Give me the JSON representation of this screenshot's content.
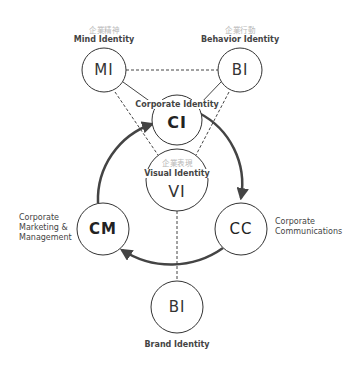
{
  "diagram": {
    "title": "",
    "nodes": {
      "mi": {
        "abbr": "MI",
        "label": "Mind Identity",
        "label_jp": "企業精神"
      },
      "bi_top": {
        "abbr": "BI",
        "label": "Behavior Identity",
        "label_jp": "企業行動"
      },
      "ci": {
        "abbr": "CI",
        "label": "Corporate Identity"
      },
      "vi": {
        "abbr": "VI",
        "label": "Visual Identity",
        "label_jp": "企業表現"
      },
      "cm": {
        "abbr": "CM",
        "label_lines": [
          "Corporate",
          "Marketing &",
          "Management"
        ]
      },
      "cc": {
        "abbr": "CC",
        "label_lines": [
          "Corporate",
          "Communications"
        ]
      },
      "bi_bottom": {
        "abbr": "BI",
        "label": "Brand Identity"
      }
    },
    "edges": [
      {
        "from": "MI",
        "to": "CI",
        "style": "solid"
      },
      {
        "from": "BI",
        "to": "CI",
        "style": "solid"
      },
      {
        "from": "MI",
        "to": "BI",
        "style": "dashed"
      },
      {
        "from": "MI",
        "to": "VI",
        "style": "dashed"
      },
      {
        "from": "BI",
        "to": "VI",
        "style": "dashed"
      },
      {
        "from": "VI",
        "to": "BI (Brand)",
        "style": "dashed"
      },
      {
        "from": "CI",
        "to": "CC",
        "style": "thick-arrow"
      },
      {
        "from": "CC",
        "to": "CM",
        "style": "thick-arrow"
      },
      {
        "from": "CM",
        "to": "CI",
        "style": "thick-arrow"
      }
    ],
    "colors": {
      "stroke": "#333333",
      "jp_text": "#b8b8b8",
      "text": "#444444"
    }
  }
}
